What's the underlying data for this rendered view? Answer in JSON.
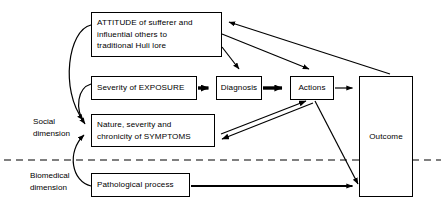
{
  "diagram": {
    "width": 445,
    "height": 213,
    "stroke_color": "#000000",
    "background_color": "#ffffff",
    "nodes": [
      {
        "id": "attitude",
        "label": "ATTITUDE of sufferer and\ninfluential others to\ntraditional Huli lore",
        "x": 91,
        "y": 12,
        "w": 131,
        "h": 45,
        "align": "left"
      },
      {
        "id": "exposure",
        "label": "Severity of EXPOSURE",
        "x": 91,
        "y": 76,
        "w": 106,
        "h": 24,
        "align": "left"
      },
      {
        "id": "diagnosis",
        "label": "Diagnosis",
        "x": 216,
        "y": 76,
        "w": 46,
        "h": 24,
        "align": "center"
      },
      {
        "id": "actions",
        "label": "Actions",
        "x": 290,
        "y": 76,
        "w": 44,
        "h": 24,
        "align": "center"
      },
      {
        "id": "outcome",
        "label": "Outcome",
        "x": 359,
        "y": 76,
        "w": 54,
        "h": 121,
        "align": "center"
      },
      {
        "id": "symptoms",
        "label": "Nature, severity and\nchronicity of SYMPTOMS",
        "x": 91,
        "y": 114,
        "w": 124,
        "h": 33,
        "align": "left"
      },
      {
        "id": "pathological",
        "label": "Pathological process",
        "x": 91,
        "y": 173,
        "w": 99,
        "h": 24,
        "align": "left"
      }
    ],
    "dimension_labels": [
      {
        "id": "social",
        "label": "Social\ndimension",
        "x": 33,
        "y": 116
      },
      {
        "id": "biomedical",
        "label": "Biomedical\ndimension",
        "x": 30,
        "y": 170
      }
    ],
    "divider": {
      "id": "social-biomedical-divider",
      "style": "dashed",
      "y": 160,
      "x1": 4,
      "x2": 441
    },
    "edges": [
      {
        "id": "exposure-to-diagnosis",
        "from": "exposure",
        "to": "diagnosis",
        "weight": "thick"
      },
      {
        "id": "diagnosis-to-actions",
        "from": "diagnosis",
        "to": "actions",
        "weight": "thick"
      },
      {
        "id": "actions-to-outcome",
        "from": "actions",
        "to": "outcome",
        "weight": "thin"
      },
      {
        "id": "attitude-to-diagnosis",
        "from": "attitude",
        "to": "diagnosis",
        "weight": "thin"
      },
      {
        "id": "attitude-to-actions",
        "from": "attitude",
        "to": "actions",
        "weight": "thin"
      },
      {
        "id": "outcome-to-attitude",
        "from": "outcome",
        "to": "attitude",
        "weight": "thin"
      },
      {
        "id": "attitude-to-symptoms",
        "from": "attitude",
        "to": "symptoms",
        "weight": "curved"
      },
      {
        "id": "exposure-to-symptoms",
        "from": "exposure",
        "to": "symptoms",
        "weight": "curved"
      },
      {
        "id": "pathological-to-symptoms",
        "from": "pathological",
        "to": "symptoms",
        "weight": "curved"
      },
      {
        "id": "symptoms-actions-bidirectional",
        "from": "symptoms",
        "to": "actions",
        "weight": "double-line-bidirectional"
      },
      {
        "id": "actions-to-outcome-lower",
        "from": "actions",
        "to": "outcome",
        "weight": "thin"
      },
      {
        "id": "pathological-to-outcome",
        "from": "pathological",
        "to": "outcome",
        "weight": "thick"
      }
    ]
  }
}
